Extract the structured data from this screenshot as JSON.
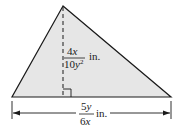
{
  "figure": {
    "type": "triangle-area",
    "fill_color": "#e6e6e6",
    "stroke_color": "#1a1a1a",
    "height_label": {
      "numerator": "4x",
      "denominator": "10y",
      "denominator_exponent": "2",
      "unit": "in."
    },
    "base_label": {
      "numerator": "5y",
      "denominator": "6x",
      "unit": "in."
    }
  }
}
